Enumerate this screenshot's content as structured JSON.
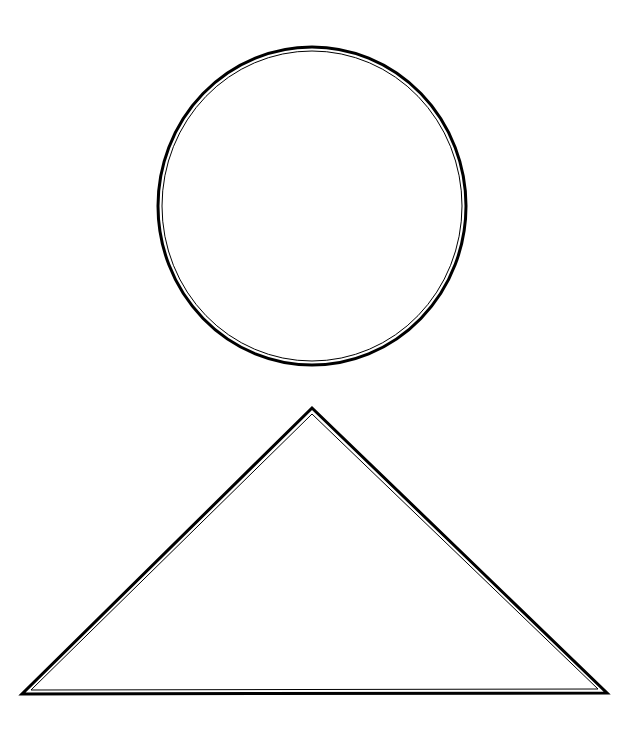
{
  "canvas": {
    "width": 636,
    "height": 733,
    "background": "#ffffff"
  },
  "shapes": [
    {
      "type": "circle",
      "name": "circle-shape",
      "cx": 312,
      "cy": 206,
      "rx": 154,
      "ry": 159,
      "fill": "#ffffff",
      "outer_stroke": "#000000",
      "outer_stroke_width": 3,
      "inner_stroke": "#000000",
      "inner_stroke_width": 1,
      "style": "double-line"
    },
    {
      "type": "triangle",
      "name": "triangle-shape",
      "points": [
        [
          312,
          408
        ],
        [
          22,
          694
        ],
        [
          607,
          693
        ]
      ],
      "fill": "#ffffff",
      "outer_stroke": "#000000",
      "outer_stroke_width": 3,
      "inner_stroke": "#000000",
      "inner_stroke_width": 1,
      "style": "double-line"
    }
  ]
}
